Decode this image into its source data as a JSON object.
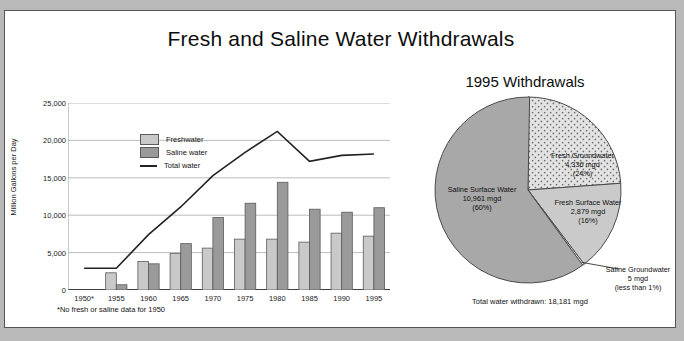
{
  "title": "Fresh and Saline Water Withdrawals",
  "bar_chart": {
    "ylabel": "Million Gallons per Day",
    "footnote": "*No fresh or saline data for 1950",
    "legend": [
      {
        "label": "Freshwater",
        "type": "swatch",
        "color": "#c9c9c9"
      },
      {
        "label": "Saline water",
        "type": "swatch",
        "color": "#9a9a9a"
      },
      {
        "label": "Total water",
        "type": "line",
        "color": "#222222"
      }
    ]
  },
  "pie_chart": {
    "title": "1995 Withdrawals",
    "total_text": "Total water withdrawn: 18,181 mgd",
    "labels": {
      "saline_surface": {
        "name": "Saline Surface Water",
        "value": "10,961 mgd",
        "pct": "(60%)"
      },
      "fresh_ground": {
        "name": "Fresh Groundwater",
        "value": "4,336 mgd",
        "pct": "(24%)"
      },
      "fresh_surface": {
        "name": "Fresh Surface Water",
        "value": "2,879 mgd",
        "pct": "(16%)"
      },
      "saline_ground": {
        "name": "Saline Groundwater",
        "value": "5 mgd",
        "pct": "(less than 1%)"
      }
    }
  },
  "chart_data": [
    {
      "type": "bar",
      "title": "Fresh and Saline Water Withdrawals",
      "xlabel": "",
      "ylabel": "Million Gallons per Day",
      "ylim": [
        0,
        25000
      ],
      "yticks": [
        "0",
        "5,000",
        "10,000",
        "15,000",
        "20,000",
        "25,000"
      ],
      "ytick_values": [
        0,
        5000,
        10000,
        15000,
        20000,
        25000
      ],
      "grid": true,
      "legend_position": "upper-left-inside",
      "categories": [
        "1950*",
        "1955",
        "1960",
        "1965",
        "1970",
        "1975",
        "1980",
        "1985",
        "1990",
        "1995"
      ],
      "series": [
        {
          "name": "Freshwater",
          "type": "bar",
          "color": "#c9c9c9",
          "values": [
            null,
            2300,
            3800,
            4900,
            5600,
            6800,
            6800,
            6400,
            7600,
            7200
          ]
        },
        {
          "name": "Saline water",
          "type": "bar",
          "color": "#9a9a9a",
          "values": [
            null,
            700,
            3500,
            6200,
            9700,
            11600,
            14400,
            10800,
            10400,
            11000
          ]
        },
        {
          "name": "Total water",
          "type": "line",
          "color": "#222222",
          "values": [
            2900,
            2900,
            7400,
            11100,
            15300,
            18400,
            21200,
            17200,
            18000,
            18181
          ]
        }
      ]
    },
    {
      "type": "pie",
      "title": "1995 Withdrawals",
      "total": 18181,
      "total_label": "Total water withdrawn: 18,181 mgd",
      "unit": "mgd",
      "slices": [
        {
          "label": "Saline Surface Water",
          "value": 10961,
          "pct": 60,
          "color": "#a8a8a8",
          "pattern": "solid"
        },
        {
          "label": "Fresh Groundwater",
          "value": 4336,
          "pct": 24,
          "color": "#dedede",
          "pattern": "dots"
        },
        {
          "label": "Fresh Surface Water",
          "value": 2879,
          "pct": 16,
          "color": "#cacaca",
          "pattern": "solid"
        },
        {
          "label": "Saline Groundwater",
          "value": 5,
          "pct": 0.03,
          "pct_label": "less than 1%",
          "color": "#ffffff",
          "pattern": "solid"
        }
      ]
    }
  ]
}
